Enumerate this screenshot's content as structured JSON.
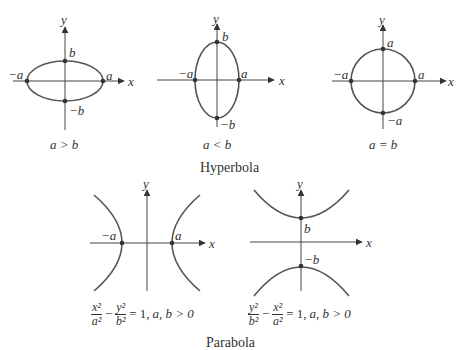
{
  "ellipses": [
    {
      "caption": "a > b",
      "labels": {
        "y": "y",
        "x": "x",
        "b": "b",
        "neg_b": "−b",
        "neg_a": "−a",
        "a": "a"
      }
    },
    {
      "caption": "a < b",
      "labels": {
        "y": "y",
        "x": "x",
        "b": "b",
        "neg_b": "−b",
        "neg_a": "−a",
        "a": "a"
      }
    },
    {
      "caption": "a = b",
      "labels": {
        "y": "y",
        "x": "x",
        "top": "a",
        "bottom": "−a",
        "neg_a": "−a",
        "a": "a"
      }
    }
  ],
  "hyperbola_title": "Hyperbola",
  "hyperbolas": [
    {
      "labels": {
        "y": "y",
        "x": "x",
        "neg_a": "−a",
        "a": "a"
      },
      "equation": {
        "t1_num": "x²",
        "t1_den": "a²",
        "t2_num": "y²",
        "t2_den": "b²",
        "minus": "−",
        "rhs": "= 1,",
        "cond": "a, b > 0"
      }
    },
    {
      "labels": {
        "y": "y",
        "x": "x",
        "b": "b",
        "neg_b": "−b"
      },
      "equation": {
        "t1_num": "y²",
        "t1_den": "b²",
        "t2_num": "x²",
        "t2_den": "a²",
        "minus": "−",
        "rhs": "= 1,",
        "cond": "a, b > 0"
      }
    }
  ],
  "next_section_title": "Parabola"
}
